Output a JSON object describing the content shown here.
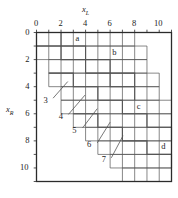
{
  "figure": {
    "type": "staircase-region-diagram",
    "background": "#ffffff",
    "line_color": "#555555",
    "border_color": "#2b2b2b",
    "text_color": "#1c1c1c"
  },
  "axes": {
    "x": {
      "name": "x",
      "subscript": "L",
      "position": "top",
      "min": 0,
      "max": 11,
      "tick_labels": [
        "0",
        "2",
        "4",
        "6",
        "8",
        "10"
      ],
      "tick_values": [
        0,
        2,
        4,
        6,
        8,
        10
      ],
      "minor_step": 1
    },
    "y": {
      "name": "x",
      "subscript": "R",
      "position": "left",
      "min": 0,
      "max": 11,
      "tick_labels": [
        "0",
        "2",
        "4",
        "6",
        "8",
        "10"
      ],
      "tick_values": [
        0,
        2,
        4,
        6,
        8,
        10
      ],
      "minor_step": 1
    }
  },
  "region_labels": [
    {
      "text": "a",
      "x": 3.35,
      "y": 0.45
    },
    {
      "text": "b",
      "x": 6.35,
      "y": 1.45
    },
    {
      "text": "c",
      "x": 8.35,
      "y": 5.45
    },
    {
      "text": "d",
      "x": 10.35,
      "y": 8.45
    }
  ],
  "leader_labels": [
    {
      "text": "3",
      "x": 0.75,
      "y": 5.0
    },
    {
      "text": "4",
      "x": 2.0,
      "y": 6.2
    },
    {
      "text": "5",
      "x": 3.1,
      "y": 7.2
    },
    {
      "text": "6",
      "x": 4.3,
      "y": 8.3
    },
    {
      "text": "7",
      "x": 5.5,
      "y": 9.4
    }
  ],
  "chart_data": {
    "type": "table",
    "title": "",
    "xlabel": "x_L",
    "ylabel": "x_R",
    "xlim": [
      0,
      11
    ],
    "ylim": [
      0,
      11
    ],
    "grid": true,
    "note": "Nested staircase boundaries; each band is one unit wide and descends one step per unit.",
    "staircases": [
      {
        "name": "a",
        "start_x": 0,
        "start_y": 0,
        "end_x": 8,
        "end_y": 4,
        "steps": 4
      },
      {
        "name": "b",
        "start_x": 0,
        "start_y": 1,
        "end_x": 9,
        "end_y": 5,
        "steps": 4
      },
      {
        "name": "c",
        "start_x": 1,
        "start_y": 3,
        "end_x": 10,
        "end_y": 8,
        "steps": 5
      },
      {
        "name": "d",
        "start_x": 3,
        "start_y": 6,
        "end_x": 11,
        "end_y": 11,
        "steps": 5
      }
    ]
  }
}
